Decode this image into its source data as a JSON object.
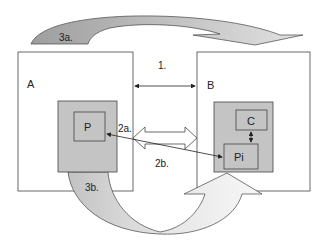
{
  "diagram": {
    "labels": {
      "box_a": "A",
      "box_b": "B",
      "inner_p": "P",
      "inner_c": "C",
      "inner_pi": "Pi",
      "arrow_1": "1.",
      "arrow_2a": "2a.",
      "arrow_2b": "2b.",
      "arrow_3a": "3a.",
      "arrow_3b": "3b."
    },
    "colors": {
      "stroke": "#333333",
      "gray_box": "#c4c4c4",
      "arrow_3a_dark": "#a9a9a9",
      "arrow_3a_light": "#d9d9d9",
      "arrow_3b_dark": "#c8c8c8",
      "arrow_3b_light": "#f4f4f4"
    }
  }
}
